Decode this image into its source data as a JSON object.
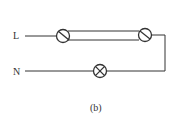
{
  "diagram": {
    "type": "circuit",
    "caption": "(b)",
    "terminals": {
      "live": "L",
      "neutral": "N"
    },
    "components": [
      {
        "id": "switch-1",
        "kind": "two-way-switch",
        "label": ""
      },
      {
        "id": "switch-2",
        "kind": "two-way-switch",
        "label": ""
      },
      {
        "id": "lamp",
        "kind": "lamp",
        "label": ""
      }
    ],
    "connections": [
      {
        "from": "L",
        "to": "switch-1"
      },
      {
        "from": "switch-1",
        "to": "switch-2",
        "note": "two parallel traveller wires"
      },
      {
        "from": "switch-2",
        "to": "lamp"
      },
      {
        "from": "lamp",
        "to": "N"
      }
    ],
    "colors": {
      "stroke": "#333333",
      "background": "#ffffff"
    }
  }
}
